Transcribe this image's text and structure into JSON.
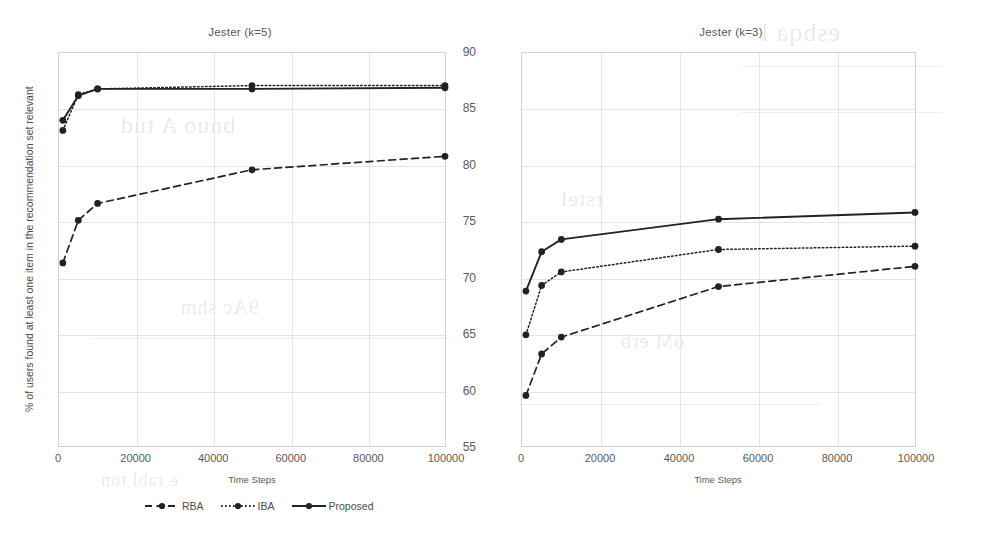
{
  "figure": {
    "background_color": "#ffffff",
    "line_color": "#222222",
    "grid_color": "#e4e4e6",
    "axis_color": "#d2d2d4",
    "text_color": "#5a5a5c"
  },
  "yaxis": {
    "title_left": "% of users found at least  one item in the recommendation set relevant",
    "ticks": [
      "90",
      "85",
      "80",
      "75",
      "70",
      "65",
      "60",
      "55"
    ],
    "min": 55,
    "max": 90
  },
  "xaxis": {
    "title": "Time Steps",
    "ticks": [
      "0",
      "20000",
      "40000",
      "60000",
      "80000",
      "100000"
    ],
    "min": 0,
    "max": 100000
  },
  "legend": {
    "items": [
      {
        "label": "RBA",
        "style": "dashed"
      },
      {
        "label": "IBA",
        "style": "dotted"
      },
      {
        "label": "Proposed",
        "style": "solid"
      }
    ]
  },
  "chart_data": [
    {
      "type": "line",
      "title": "Jester (k=5)",
      "xlabel": "Time Steps",
      "ylabel": "% of users found at least  one item in the recommendation set relevant",
      "xlim": [
        0,
        100000
      ],
      "ylim": [
        55,
        90
      ],
      "grid": true,
      "legend_position": "bottom",
      "x": [
        1000,
        5000,
        10000,
        50000,
        100000
      ],
      "series": [
        {
          "name": "RBA",
          "style": "dashed",
          "values": [
            71.3,
            75.1,
            76.6,
            79.6,
            80.8
          ]
        },
        {
          "name": "IBA",
          "style": "dotted",
          "values": [
            83.1,
            86.3,
            86.8,
            87.1,
            87.1
          ]
        },
        {
          "name": "Proposed",
          "style": "solid",
          "values": [
            84.0,
            86.2,
            86.8,
            86.8,
            86.9
          ]
        }
      ]
    },
    {
      "type": "line",
      "title": "Jester (k=3)",
      "xlabel": "Time Steps",
      "ylabel": "",
      "xlim": [
        0,
        100000
      ],
      "ylim": [
        55,
        90
      ],
      "grid": true,
      "legend_position": "bottom",
      "x": [
        1000,
        5000,
        10000,
        50000,
        100000
      ],
      "series": [
        {
          "name": "RBA",
          "style": "dashed",
          "values": [
            59.5,
            63.2,
            64.7,
            69.2,
            71.0
          ]
        },
        {
          "name": "IBA",
          "style": "dotted",
          "values": [
            64.9,
            69.3,
            70.5,
            72.5,
            72.8
          ]
        },
        {
          "name": "Proposed",
          "style": "solid",
          "values": [
            68.8,
            72.3,
            73.4,
            75.2,
            75.8
          ]
        }
      ]
    }
  ],
  "scan_artifacts": {
    "note": "faint bleed-through from reverse page"
  }
}
